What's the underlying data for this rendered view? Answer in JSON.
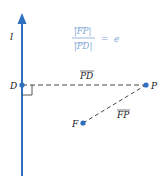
{
  "diagram": {
    "line_label": "l",
    "points": {
      "D": {
        "label": "D"
      },
      "P": {
        "label": "P"
      },
      "F": {
        "label": "F"
      }
    },
    "segments": {
      "PD": {
        "label": "PD"
      },
      "FP": {
        "label": "FP"
      }
    },
    "formula": {
      "numerator": "|FP|",
      "denominator": "|PD|",
      "equals": "=",
      "rhs": "e"
    },
    "colors": {
      "accent": "#2f6fbf",
      "formula": "#7fa6d4",
      "dash": "#444444"
    }
  }
}
